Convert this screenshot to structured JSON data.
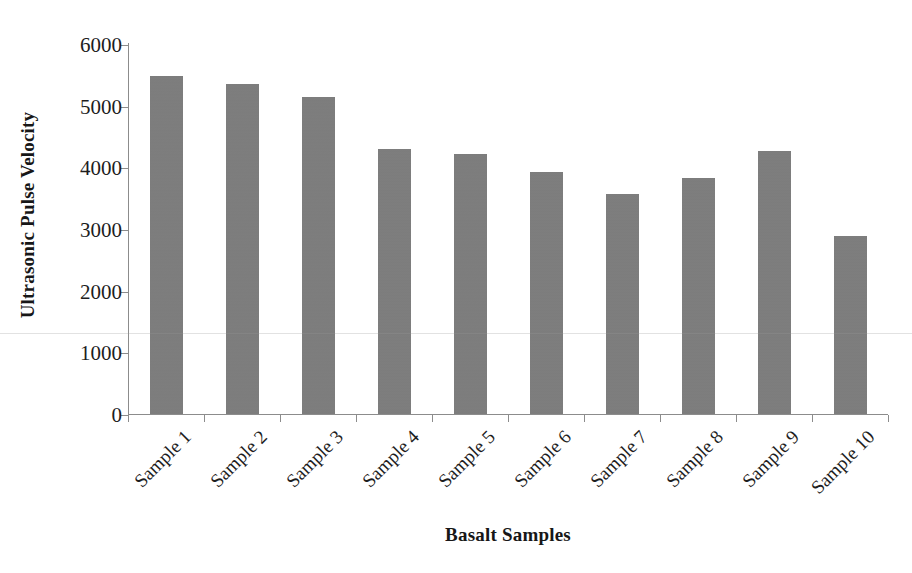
{
  "chart_data": {
    "type": "bar",
    "title": "",
    "subtitle": "",
    "xlabel": "Basalt Samples",
    "ylabel": "Ultrasonic Pulse Velocity",
    "categories": [
      "Sample 1",
      "Sample 2",
      "Sample 3",
      "Sample 4",
      "Sample 5",
      "Sample 6",
      "Sample 7",
      "Sample 8",
      "Sample 9",
      "Sample 10"
    ],
    "values": [
      5480,
      5350,
      5140,
      4300,
      4210,
      3930,
      3570,
      3830,
      4270,
      2890
    ],
    "ylim": [
      0,
      6000
    ],
    "yticks": [
      0,
      1000,
      2000,
      3000,
      4000,
      5000,
      6000
    ],
    "ytick_labels": [
      "0",
      "1000",
      "2000",
      "3000",
      "4000",
      "5000",
      "6000"
    ],
    "grid": false,
    "legend": false,
    "legend_position": "none",
    "bar_color": "#7d7d7d",
    "axis_color": "#8c8c8c",
    "text_color": "#1a1a1a",
    "x_tick_label_rotation": -45,
    "annotations": []
  }
}
